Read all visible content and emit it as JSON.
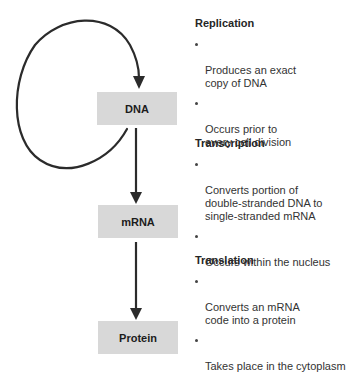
{
  "diagram": {
    "colors": {
      "node_fill": "#d8d8d8",
      "arrow": "#2b2b2b",
      "heading_text": "#262626",
      "body_text": "#333333"
    },
    "nodes": [
      {
        "id": "dna",
        "label": "DNA"
      },
      {
        "id": "mrna",
        "label": "mRNA"
      },
      {
        "id": "protein",
        "label": "Protein"
      }
    ],
    "edges": [
      {
        "from": "dna",
        "to": "dna",
        "label": "Replication",
        "type": "loop"
      },
      {
        "from": "dna",
        "to": "mrna",
        "label": "Transcription"
      },
      {
        "from": "mrna",
        "to": "protein",
        "label": "Translation"
      }
    ],
    "sections": [
      {
        "heading": "Replication",
        "bullets": [
          "Produces an exact\ncopy of DNA",
          "Occurs prior to\nevery cell division"
        ]
      },
      {
        "heading": "Transcription",
        "bullets": [
          "Converts portion of\ndouble-stranded DNA to\nsingle-stranded mRNA",
          "Occurs within the nucleus"
        ]
      },
      {
        "heading": "Translation",
        "bullets": [
          "Converts an mRNA\ncode into a protein",
          "Takes place in the cytoplasm"
        ]
      }
    ]
  }
}
